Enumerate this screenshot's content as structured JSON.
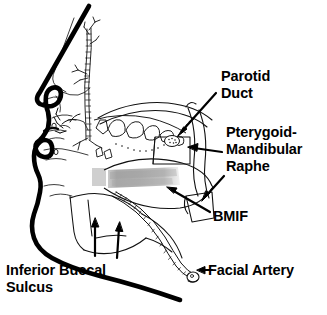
{
  "figure": {
    "background_color": "#ffffff",
    "ink_color": "#000000",
    "muscle_band_color": "#b4b4b4"
  },
  "labels": {
    "parotid_duct_line1": "Parotid",
    "parotid_duct_line2": "Duct",
    "pterygoid_line1": "Pterygoid-",
    "pterygoid_line2": "Mandibular",
    "pterygoid_line3": "Raphe",
    "bmif": "BMIF",
    "facial_artery": "Facial Artery",
    "inferior_buccal_line1": "Inferior Buccal",
    "inferior_buccal_line2": "Sulcus"
  },
  "structures": {
    "facial_profile": "heavy-black-profile-outline",
    "nose": "nasal-dorsum-and-ala",
    "lips": "upper-and-lower-lip",
    "chin": "mentum",
    "maxillary_teeth": "upper-dental-arch",
    "mandible": "mandibular-body-and-ramus",
    "buccinator_muscle": "gray-shaded-horizontal-band",
    "parotid_duct": "stippled-duct-to-upper-molar",
    "pterygomandibular_raphe": "raphe-band",
    "facial_artery_vessel": "wavy-vessel-along-mandible",
    "infraorbital_nerve": "vertical-nerve-branch-line"
  },
  "pointers": {
    "parotid_duct_arrow": "arrow-down-left",
    "pterygoid_arrow": "arrow-left",
    "bmif_arrow": "arrow-up-left",
    "facial_artery_arrow": "arrow-left",
    "sulcus_arrow_1": "arrow-up",
    "sulcus_arrow_2": "arrow-up"
  }
}
